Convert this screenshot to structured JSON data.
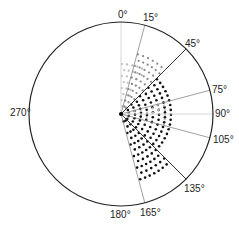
{
  "diagram": {
    "type": "polar-sector-diagram",
    "center": [
      121,
      114
    ],
    "radius": 92,
    "colors": {
      "circle": "#222222",
      "line_dark": "#333333",
      "line_mid": "#888888",
      "line_light": "#cccccc",
      "dots_light": "#bbbbbb",
      "dots_mid": "#888888",
      "dots_dark": "#111111"
    },
    "angle_labels": [
      {
        "angle": 0,
        "text": "0°",
        "x": 118,
        "y": 10
      },
      {
        "angle": 15,
        "text": "15°",
        "x": 143,
        "y": 13
      },
      {
        "angle": 45,
        "text": "45°",
        "x": 185,
        "y": 39
      },
      {
        "angle": 75,
        "text": "75°",
        "x": 212,
        "y": 85
      },
      {
        "angle": 90,
        "text": "90°",
        "x": 215,
        "y": 109
      },
      {
        "angle": 105,
        "text": "105°",
        "x": 213,
        "y": 135
      },
      {
        "angle": 135,
        "text": "135°",
        "x": 184,
        "y": 184
      },
      {
        "angle": 165,
        "text": "165°",
        "x": 140,
        "y": 208
      },
      {
        "angle": 180,
        "text": "180°",
        "x": 110,
        "y": 210
      },
      {
        "angle": 270,
        "text": "270°",
        "x": 10,
        "y": 108
      }
    ],
    "radial_lines": [
      {
        "angle": 0,
        "style": "light"
      },
      {
        "angle": 15,
        "style": "mid"
      },
      {
        "angle": 45,
        "style": "dark"
      },
      {
        "angle": 75,
        "style": "mid"
      },
      {
        "angle": 90,
        "style": "light"
      },
      {
        "angle": 105,
        "style": "mid"
      },
      {
        "angle": 135,
        "style": "dark"
      },
      {
        "angle": 165,
        "style": "mid"
      }
    ],
    "dot_sectors": [
      {
        "from": 0,
        "to": 30,
        "max_r": 55,
        "tone": "light"
      },
      {
        "from": 15,
        "to": 45,
        "max_r": 62,
        "tone": "mid"
      },
      {
        "from": 45,
        "to": 90,
        "max_r": 55,
        "tone": "dark"
      },
      {
        "from": 75,
        "to": 105,
        "max_r": 45,
        "tone": "light"
      },
      {
        "from": 90,
        "to": 135,
        "max_r": 52,
        "tone": "dark"
      },
      {
        "from": 135,
        "to": 165,
        "max_r": 68,
        "tone": "dark"
      }
    ]
  }
}
